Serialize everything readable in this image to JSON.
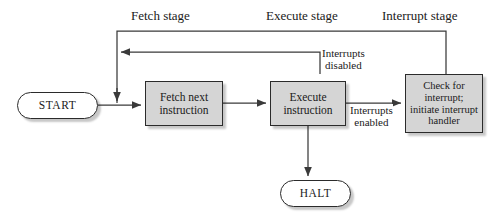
{
  "diagram": {
    "stage_labels": [
      {
        "id": "fetch-stage",
        "text": "Fetch stage"
      },
      {
        "id": "execute-stage",
        "text": "Execute stage"
      },
      {
        "id": "interrupt-stage",
        "text": "Interrupt stage"
      }
    ],
    "nodes": {
      "start": {
        "text": "START",
        "shape": "rounded-terminal"
      },
      "fetch": {
        "line1": "Fetch next",
        "line2": "instruction",
        "shape": "process-box"
      },
      "execute": {
        "line1": "Execute",
        "line2": "instruction",
        "shape": "process-box"
      },
      "interrupt": {
        "line1": "Check for",
        "line2": "interrupt;",
        "line3": "initiate interrupt",
        "line4": "handler",
        "shape": "process-box"
      },
      "halt": {
        "text": "HALT",
        "shape": "rounded-terminal"
      }
    },
    "edge_labels": [
      {
        "id": "interrupts-disabled",
        "line1": "Interrupts",
        "line2": "disabled"
      },
      {
        "id": "interrupts-enabled",
        "line1": "Interrupts",
        "line2": "enabled"
      }
    ],
    "colors": {
      "box_fill": "#d5d5d5",
      "box_stroke": "#2b2b2b",
      "terminal_fill": "#ffffff",
      "line": "#3a3a3a",
      "text": "#1a1a1a",
      "background": "#ffffff"
    }
  }
}
